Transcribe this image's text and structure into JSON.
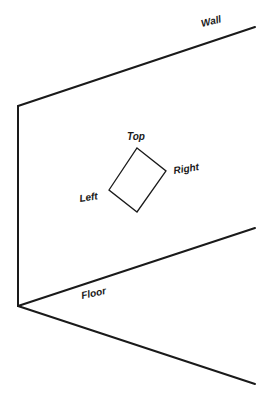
{
  "diagram": {
    "colors": {
      "line": "#1a1a1a",
      "background": "#ffffff"
    },
    "labels": {
      "wall": "Wall",
      "floor": "Floor",
      "top": "Top",
      "right": "Right",
      "left": "Left"
    },
    "geometry": {
      "wall_top_edge": {
        "from": [
          18,
          106
        ],
        "to": [
          255,
          27
        ]
      },
      "vertical_corner_edge": {
        "from": [
          18,
          106
        ],
        "to": [
          18,
          306
        ]
      },
      "wall_floor_edge": {
        "from": [
          18,
          306
        ],
        "to": [
          255,
          228
        ]
      },
      "floor_front_edge": {
        "from": [
          18,
          306
        ],
        "to": [
          255,
          384
        ]
      },
      "tilted_rectangle": {
        "top": [
          137,
          148
        ],
        "right": [
          166,
          171
        ],
        "bottom": [
          137,
          212
        ],
        "left": [
          109,
          190
        ]
      }
    }
  }
}
